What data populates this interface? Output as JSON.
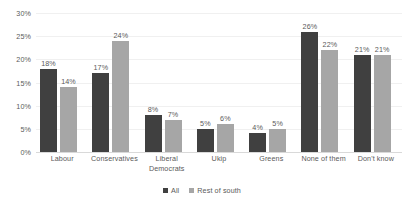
{
  "chart_data": {
    "type": "bar",
    "title": "",
    "xlabel": "",
    "ylabel": "",
    "ylim": [
      0,
      30
    ],
    "ytick_labels": [
      "0%",
      "5%",
      "10%",
      "15%",
      "20%",
      "25%",
      "30%"
    ],
    "ytick_values": [
      0,
      5,
      10,
      15,
      20,
      25,
      30
    ],
    "grid": true,
    "legend_position": "bottom",
    "categories": [
      "Labour",
      "Conservatives",
      "Liberal\nDemocrats",
      "Ukip",
      "Greens",
      "None of them",
      "Don't know"
    ],
    "series": [
      {
        "name": "All",
        "color": "#404040",
        "values": [
          18,
          17,
          8,
          5,
          4,
          26,
          21
        ],
        "value_labels": [
          "18%",
          "17%",
          "8%",
          "5%",
          "4%",
          "26%",
          "21%"
        ]
      },
      {
        "name": "Rest of south",
        "color": "#a6a6a6",
        "values": [
          14,
          24,
          7,
          6,
          5,
          22,
          21
        ],
        "value_labels": [
          "14%",
          "24%",
          "7%",
          "6%",
          "5%",
          "22%",
          "21%"
        ]
      }
    ]
  }
}
